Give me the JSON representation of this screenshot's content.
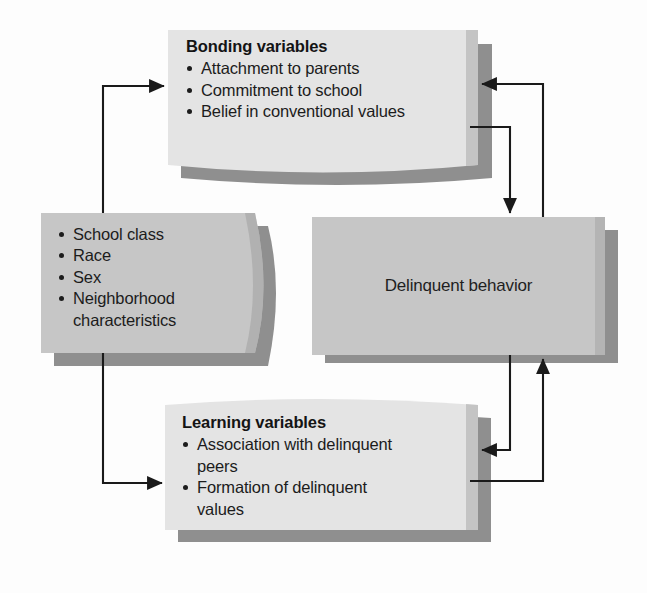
{
  "diagram": {
    "palette": {
      "light_box_fill": "#e4e4e4",
      "mid_box_fill": "#c6c6c6",
      "shadow": "#8f8f8f",
      "edge_shade": "#9d9d9d",
      "line": "#1a1a1a",
      "page_background": "#fdfdfd",
      "text": "#1c1c1c"
    },
    "boxes": [
      {
        "id": "bonding",
        "name": "bonding-variables-box",
        "title": "Bonding variables",
        "items": [
          "Attachment to parents",
          "Commitment to school",
          "Belief in conventional values"
        ]
      },
      {
        "id": "attributes",
        "name": "background-attributes-box",
        "title": "",
        "items": [
          "School class",
          "Race",
          "Sex",
          "Neighborhood characteristics"
        ]
      },
      {
        "id": "delinquent",
        "name": "delinquent-behavior-box",
        "label": "Delinquent behavior",
        "items": []
      },
      {
        "id": "learning",
        "name": "learning-variables-box",
        "title": "Learning variables",
        "items": [
          "Association with delinquent peers",
          "Formation of delinquent values"
        ]
      }
    ],
    "arrows": [
      {
        "name": "attributes-to-bonding-arrow",
        "from": "attributes",
        "to": "bonding"
      },
      {
        "name": "attributes-to-learning-arrow",
        "from": "attributes",
        "to": "learning"
      },
      {
        "name": "bonding-to-delinquent-arrow",
        "from": "bonding",
        "to": "delinquent"
      },
      {
        "name": "delinquent-to-bonding-arrow",
        "from": "delinquent",
        "to": "bonding"
      },
      {
        "name": "delinquent-to-learning-arrow",
        "from": "delinquent",
        "to": "learning"
      },
      {
        "name": "learning-to-delinquent-arrow",
        "from": "learning",
        "to": "delinquent"
      }
    ]
  },
  "text": {
    "bonding_title": "Bonding variables",
    "bonding_item_1": "Attachment to parents",
    "bonding_item_2": "Commitment to school",
    "bonding_item_3": "Belief in conventional values",
    "attr_item_1": "School class",
    "attr_item_2": "Race",
    "attr_item_3": "Sex",
    "attr_item_4a": "Neighborhood",
    "attr_item_4b": "characteristics",
    "delinquent_label": "Delinquent behavior",
    "learning_title": "Learning variables",
    "learning_item_1a": "Association with delinquent",
    "learning_item_1b": "peers",
    "learning_item_2a": "Formation of delinquent",
    "learning_item_2b": "values"
  }
}
